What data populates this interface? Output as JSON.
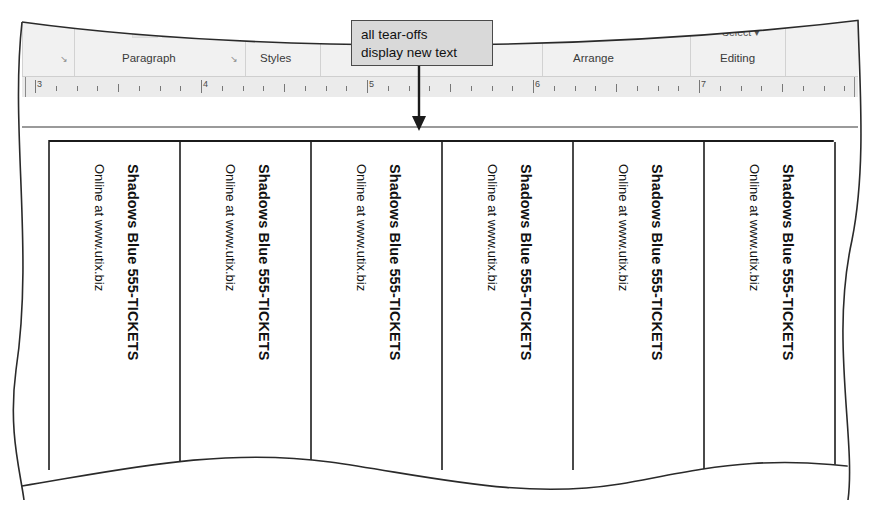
{
  "callout": {
    "line1": "all tear-offs",
    "line2": "display new text"
  },
  "ribbon": {
    "groups": [
      {
        "label": "Paragraph",
        "launcher": "↘"
      },
      {
        "label": "Styles",
        "launcher": "↘"
      },
      {
        "label": "Arrange",
        "launcher": ""
      },
      {
        "label": "Editing",
        "launcher": ""
      }
    ],
    "buttons": [
      {
        "label": "Text ▾"
      },
      {
        "label": "Align"
      },
      {
        "label": "Select ▾"
      },
      {
        "label": "Text Box"
      }
    ]
  },
  "ruler": {
    "numbers": [
      "3",
      "4",
      "5",
      "6",
      "7"
    ]
  },
  "document": {
    "tearoffs": [
      {
        "title": "Shadows Blue 555-TICKETS",
        "subtitle": "Online at www.utix.biz"
      },
      {
        "title": "Shadows Blue 555-TICKETS",
        "subtitle": "Online at www.utix.biz"
      },
      {
        "title": "Shadows Blue 555-TICKETS",
        "subtitle": "Online at www.utix.biz"
      },
      {
        "title": "Shadows Blue 555-TICKETS",
        "subtitle": "Online at www.utix.biz"
      },
      {
        "title": "Shadows Blue 555-TICKETS",
        "subtitle": "Online at www.utix.biz"
      },
      {
        "title": "Shadows Blue 555-TICKETS",
        "subtitle": "Online at www.utix.biz"
      }
    ]
  },
  "colors": {
    "ribbon_bg": "#f1f1f1",
    "ruler_bg": "#ebebeb",
    "callout_bg": "#d9d9d9",
    "callout_border": "#4b4b4b",
    "text": "#111111"
  }
}
